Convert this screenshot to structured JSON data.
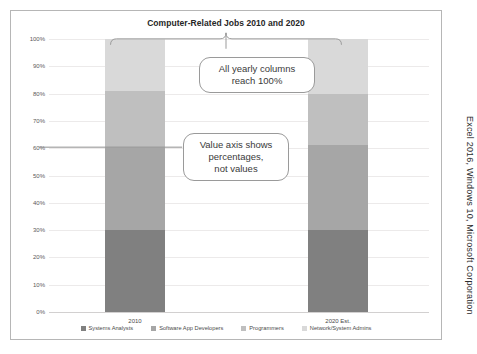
{
  "source_caption": "Excel 2016, Windows 10, Microsoft Corporation",
  "callouts": {
    "columns": {
      "line1": "All yearly columns",
      "line2": "reach 100%"
    },
    "axis": {
      "line1": "Value axis shows",
      "line2": "percentages,",
      "line3": "not values"
    }
  },
  "chart_data": {
    "type": "bar",
    "subtype": "100% stacked column",
    "title": "Computer-Related Jobs 2010 and 2020",
    "xlabel": "",
    "ylabel": "",
    "categories": [
      "2010",
      "2020 Est."
    ],
    "ytick_labels": [
      "100%",
      "90%",
      "80%",
      "70%",
      "60%",
      "50%",
      "40%",
      "30%",
      "20%",
      "10%",
      "0%"
    ],
    "ylim": [
      0,
      100
    ],
    "ytick_step": 10,
    "grid": true,
    "legend_position": "bottom",
    "value_format": "percentage",
    "series": [
      {
        "name": "Systems Analysts",
        "color": "#808080",
        "values": [
          30,
          30
        ]
      },
      {
        "name": "Software App Developers",
        "color": "#a6a6a6",
        "values": [
          30,
          31
        ]
      },
      {
        "name": "Programmers",
        "color": "#bfbfbf",
        "values": [
          21,
          19
        ]
      },
      {
        "name": "Network/System Admins",
        "color": "#d9d9d9",
        "values": [
          19,
          20
        ]
      }
    ]
  }
}
